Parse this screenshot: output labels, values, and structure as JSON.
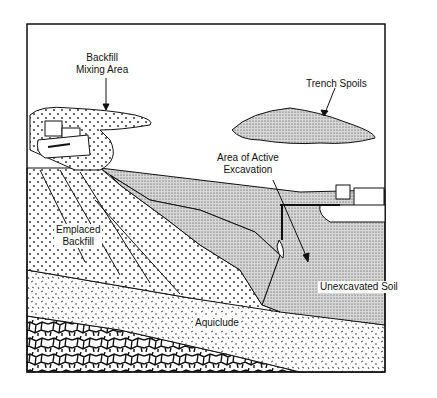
{
  "diagram": {
    "type": "cross-section",
    "labels": {
      "backfill_mixing_area": [
        "Backfill",
        "Mixing Area"
      ],
      "trench_spoils": "Trench Spoils",
      "active_excavation": [
        "Area of Active",
        "Excavation"
      ],
      "emplaced_backfill": [
        "Emplaced",
        "Backfill"
      ],
      "unexcavated_soil": "Unexcavated Soil",
      "aquiclude": "Aquiclude"
    },
    "colors": {
      "ink": "#111111",
      "background": "#ffffff",
      "soil_fill": "#cfcfcf"
    }
  }
}
